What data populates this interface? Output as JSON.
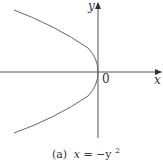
{
  "figure": {
    "type": "parabola",
    "equation": "x = -y^2",
    "caption_prefix": "(a)",
    "caption_eq_x": "x",
    "caption_eq_rest": " = −y",
    "caption_eq_sup": "2",
    "axis_labels": {
      "x": "x",
      "y": "y",
      "origin": "0"
    },
    "colors": {
      "curve": "#666666",
      "axes": "#555555",
      "text": "#333333"
    }
  }
}
